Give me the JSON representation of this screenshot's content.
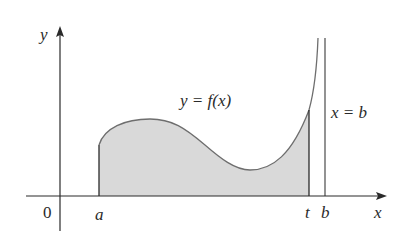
{
  "diagram": {
    "type": "improper-integral-area",
    "axes": {
      "x_label": "x",
      "y_label": "y",
      "origin_label": "0"
    },
    "curve": {
      "label": "y = f(x)"
    },
    "asymptote": {
      "label": "x = b"
    },
    "ticks": {
      "a": "a",
      "t": "t",
      "b": "b"
    },
    "colors": {
      "fill": "#d9d9d9",
      "curve": "#6e6e6e",
      "axis": "#2a2a2a",
      "background": "#ffffff"
    }
  }
}
